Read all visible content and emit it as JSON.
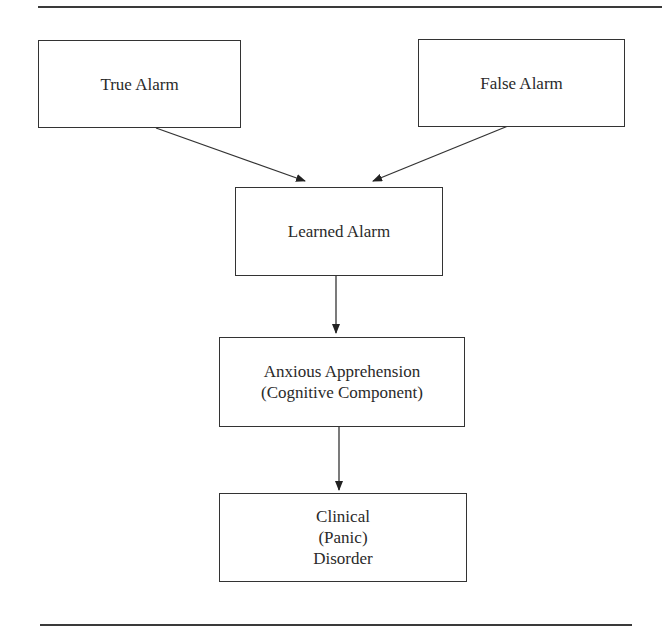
{
  "diagram": {
    "type": "flowchart",
    "nodes": {
      "true_alarm": {
        "lines": [
          "True Alarm"
        ]
      },
      "false_alarm": {
        "lines": [
          "False Alarm"
        ]
      },
      "learned_alarm": {
        "lines": [
          "Learned Alarm"
        ]
      },
      "anxious_apprehension": {
        "lines": [
          "Anxious Apprehension",
          "(Cognitive Component)"
        ]
      },
      "clinical_disorder": {
        "lines": [
          "Clinical",
          "(Panic)",
          "Disorder"
        ]
      }
    },
    "edges": [
      {
        "from": "True Alarm",
        "to": "Learned Alarm"
      },
      {
        "from": "False Alarm",
        "to": "Learned Alarm"
      },
      {
        "from": "Learned Alarm",
        "to": "Anxious Apprehension (Cognitive Component)"
      },
      {
        "from": "Anxious Apprehension (Cognitive Component)",
        "to": "Clinical (Panic) Disorder"
      }
    ]
  }
}
